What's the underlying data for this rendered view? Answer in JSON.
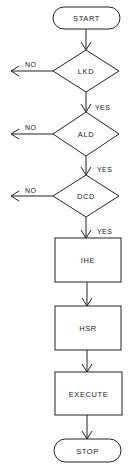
{
  "flowchart": {
    "nodes": [
      {
        "id": "start",
        "type": "terminal",
        "label": "START"
      },
      {
        "id": "lkd",
        "type": "decision",
        "label": "LKD"
      },
      {
        "id": "ald",
        "type": "decision",
        "label": "ALD"
      },
      {
        "id": "dcd",
        "type": "decision",
        "label": "DCD"
      },
      {
        "id": "ihe",
        "type": "process",
        "label": "IHE"
      },
      {
        "id": "hsr",
        "type": "process",
        "label": "HSR"
      },
      {
        "id": "execute",
        "type": "process",
        "label": "EXECUTE"
      },
      {
        "id": "stop",
        "type": "terminal",
        "label": "STOP"
      }
    ],
    "edges": [
      {
        "from": "start",
        "to": "lkd",
        "label": ""
      },
      {
        "from": "lkd",
        "to": "ald",
        "label": "YES"
      },
      {
        "from": "lkd",
        "to": "exit-left",
        "label": "NO"
      },
      {
        "from": "ald",
        "to": "dcd",
        "label": "YES"
      },
      {
        "from": "ald",
        "to": "exit-left",
        "label": "NO"
      },
      {
        "from": "dcd",
        "to": "ihe",
        "label": "YES"
      },
      {
        "from": "dcd",
        "to": "exit-left",
        "label": "NO"
      },
      {
        "from": "ihe",
        "to": "hsr",
        "label": ""
      },
      {
        "from": "hsr",
        "to": "execute",
        "label": ""
      },
      {
        "from": "execute",
        "to": "stop",
        "label": ""
      }
    ]
  }
}
